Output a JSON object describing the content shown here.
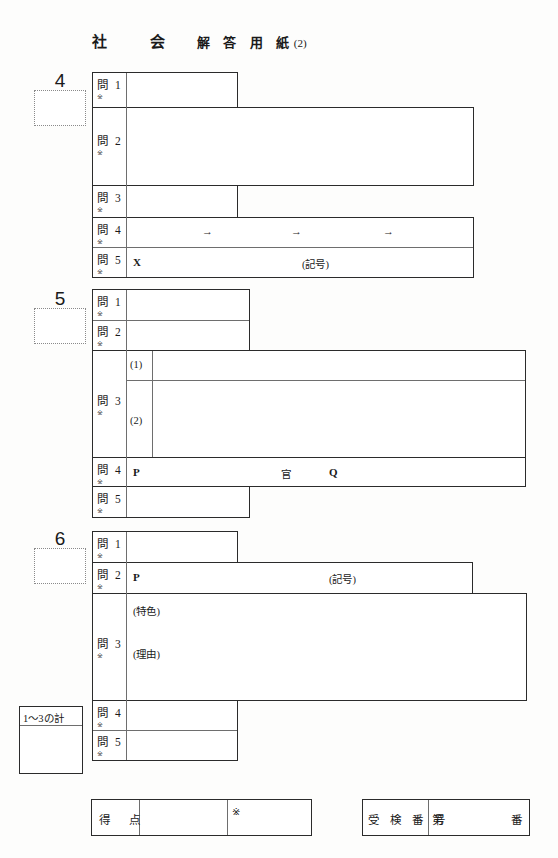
{
  "header": {
    "subject": "社　会",
    "document": "解 答 用 紙",
    "paper_number": "(2)"
  },
  "sections": [
    {
      "number": "4",
      "questions": [
        {
          "label": "問 1",
          "mark": "※",
          "notes": []
        },
        {
          "label": "問 2",
          "mark": "※",
          "notes": []
        },
        {
          "label": "問 3",
          "mark": "※",
          "notes": []
        },
        {
          "label": "問 4",
          "mark": "※",
          "notes": [
            "→",
            "→",
            "→"
          ]
        },
        {
          "label": "問 5",
          "mark": "※",
          "notes": [
            "X",
            "(記号)"
          ]
        }
      ]
    },
    {
      "number": "5",
      "questions": [
        {
          "label": "問 1",
          "mark": "※",
          "notes": []
        },
        {
          "label": "問 2",
          "mark": "※",
          "notes": []
        },
        {
          "label": "問 3",
          "mark": "※",
          "notes": [
            "(1)",
            "(2)"
          ]
        },
        {
          "label": "問 4",
          "mark": "※",
          "notes": [
            "P",
            "官",
            "Q"
          ]
        },
        {
          "label": "問 5",
          "mark": "※",
          "notes": []
        }
      ]
    },
    {
      "number": "6",
      "questions": [
        {
          "label": "問 1",
          "mark": "※",
          "notes": []
        },
        {
          "label": "問 2",
          "mark": "※",
          "notes": [
            "P",
            "(記号)"
          ]
        },
        {
          "label": "問 3",
          "mark": "※",
          "notes": [
            "(特色)",
            "(理由)"
          ]
        },
        {
          "label": "問 4",
          "mark": "※",
          "notes": []
        },
        {
          "label": "問 5",
          "mark": "※",
          "notes": []
        }
      ]
    }
  ],
  "subtotal": {
    "label": "1〜3の計",
    "value": ""
  },
  "score": {
    "label": "得　点",
    "mark": "※",
    "value": ""
  },
  "examinee": {
    "label": "受 検 番 号",
    "prefix": "第",
    "suffix": "番",
    "value": ""
  },
  "colors": {
    "ink": "#2b2b2b",
    "rule": "#6e6e6e",
    "paper": "#fdfdfc"
  }
}
